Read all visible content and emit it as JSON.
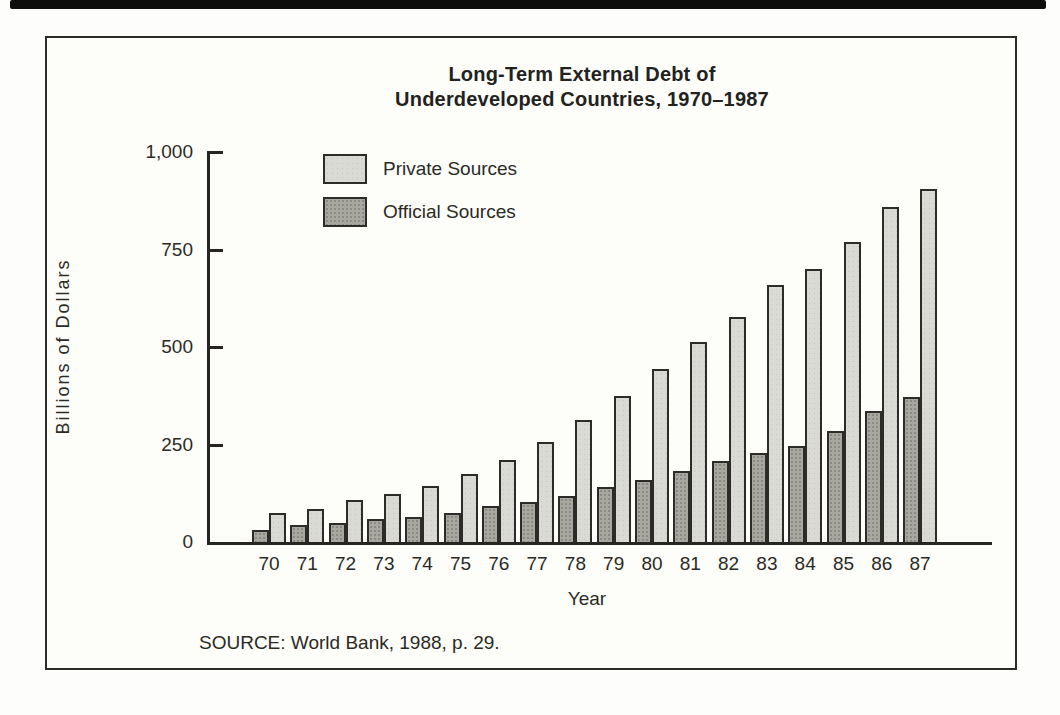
{
  "chart_data": {
    "type": "bar",
    "title": "Long-Term External Debt of Underdeveloped Countries, 1970–1987",
    "title_lines": [
      "Long-Term External Debt of",
      "Underdeveloped Countries, 1970–1987"
    ],
    "categories": [
      "70",
      "71",
      "72",
      "73",
      "74",
      "75",
      "76",
      "77",
      "78",
      "79",
      "80",
      "81",
      "82",
      "83",
      "84",
      "85",
      "86",
      "87"
    ],
    "series": [
      {
        "name": "Official Sources",
        "key": "official",
        "color": "#a8a8a1",
        "values": [
          30,
          43,
          49,
          58,
          63,
          74,
          92,
          102,
          117,
          142,
          158,
          182,
          207,
          228,
          246,
          285,
          337,
          372
        ]
      },
      {
        "name": "Private Sources",
        "key": "private",
        "color": "#dadad5",
        "values": [
          75,
          85,
          108,
          122,
          143,
          175,
          210,
          256,
          312,
          374,
          443,
          513,
          578,
          660,
          700,
          770,
          858,
          905
        ]
      }
    ],
    "legend": [
      "Private Sources",
      "Official Sources"
    ],
    "legend_position": "top-left-inside",
    "bar_order_per_category": [
      "Official Sources",
      "Private Sources"
    ],
    "xlabel": "Year",
    "ylabel": "Billions of Dollars",
    "ylim": [
      0,
      1000
    ],
    "yticks": [
      0,
      250,
      500,
      750,
      1000
    ],
    "ytick_labels": [
      "0",
      "250",
      "500",
      "750",
      "1,000"
    ],
    "grid": false,
    "source": "SOURCE: World Bank, 1988, p. 29."
  },
  "figure": {
    "frame_color": "#2c2b27",
    "top_rule_color": "#0d0d0b",
    "paper_color": "#fdfdfb"
  }
}
